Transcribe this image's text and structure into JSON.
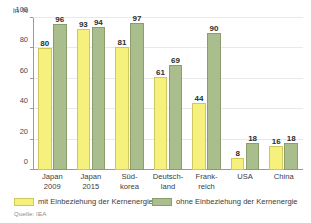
{
  "chart_data": {
    "type": "bar",
    "title": "",
    "subtitle": "",
    "unit_label": "in %",
    "xlabel": "",
    "ylabel": "in %",
    "ylim": [
      0,
      100
    ],
    "yticks": [
      0,
      20,
      40,
      60,
      80,
      100
    ],
    "ytick_labels": [
      "0",
      "20",
      "40",
      "60",
      "80",
      "100"
    ],
    "grid": true,
    "legend_position": "bottom",
    "categories": [
      "Japan 2009",
      "Japan 2015",
      "Süd-korea",
      "Deutsch-land",
      "Frank-reich",
      "USA",
      "China"
    ],
    "category_lines": [
      [
        "Japan",
        "2009"
      ],
      [
        "Japan",
        "2015"
      ],
      [
        "Süd-",
        "korea"
      ],
      [
        "Deutsch-",
        "land"
      ],
      [
        "Frank-",
        "reich"
      ],
      [
        "USA",
        ""
      ],
      [
        "China",
        ""
      ]
    ],
    "series": [
      {
        "name": "mit Einbeziehung der Kernenergie",
        "color": "#f6f07c",
        "border": "#cfc85f",
        "values": [
          80,
          93,
          81,
          61,
          44,
          8,
          16
        ]
      },
      {
        "name": "ohne Einbeziehung der Kernenergie",
        "color": "#aabd8c",
        "border": "#8a9e6d",
        "values": [
          96,
          94,
          97,
          69,
          90,
          18,
          18
        ]
      }
    ],
    "source": "Quelle: IEA"
  },
  "legend": {
    "items": [
      {
        "label": "mit Einbeziehung der Kernenergie"
      },
      {
        "label": "ohne Einbeziehung der Kernenergie"
      }
    ]
  },
  "footer": {
    "source": "Quelle: IEA"
  }
}
